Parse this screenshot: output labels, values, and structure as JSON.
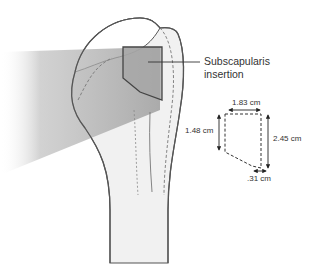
{
  "diagram": {
    "callout": {
      "line1": "Subscapularis",
      "line2": "insertion"
    },
    "footprint_dimensions": {
      "top_width": "1.83 cm",
      "left_height": "1.48 cm",
      "right_height": "2.45 cm",
      "bottom_width": ".31 cm"
    },
    "colors": {
      "outline": "#555555",
      "bone_fill": "#f1f1f1",
      "shadow": "#8a8a8a",
      "footprint_fill": "#a6a6a6",
      "text": "#333333"
    }
  }
}
